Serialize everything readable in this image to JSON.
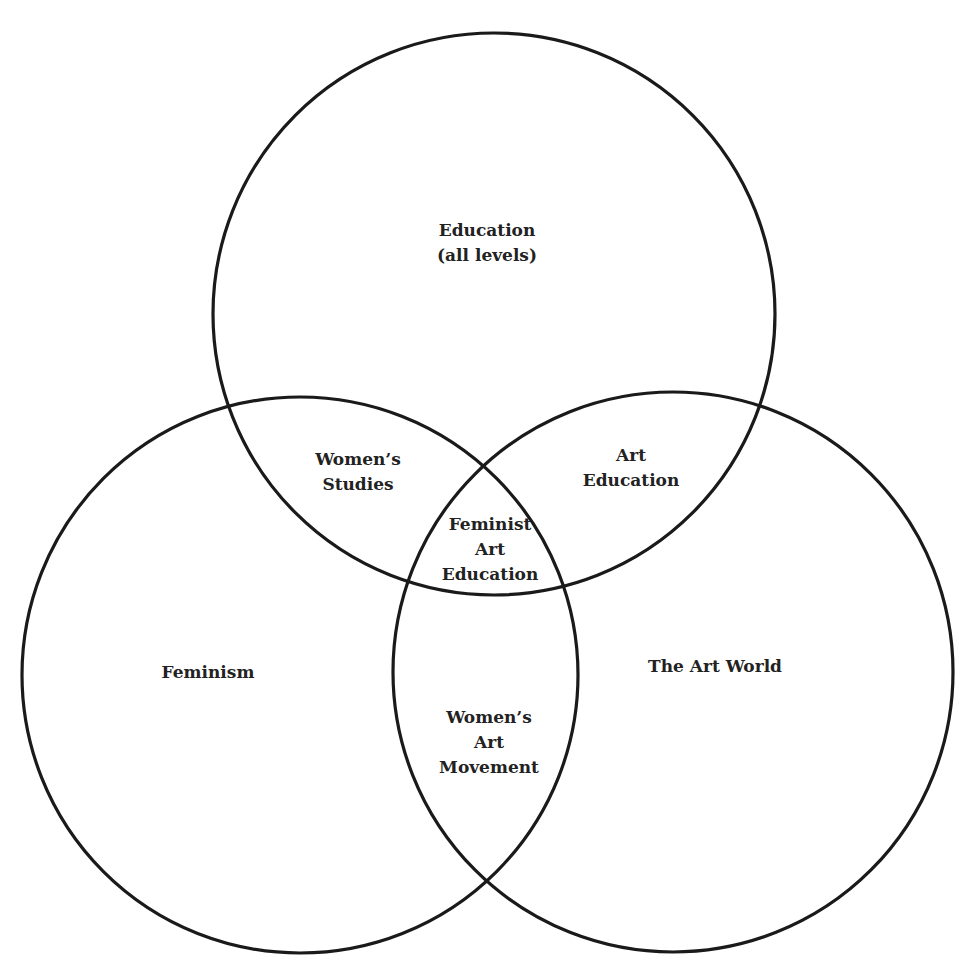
{
  "diagram": {
    "type": "venn",
    "stroke_color": "#1a1a1a",
    "background": "#ffffff",
    "circles": [
      {
        "id": "education",
        "cx": 494,
        "cy": 314,
        "r": 281
      },
      {
        "id": "feminism",
        "cx": 300,
        "cy": 675,
        "r": 278
      },
      {
        "id": "art-world",
        "cx": 673,
        "cy": 672,
        "r": 280
      }
    ],
    "regions": {
      "education": {
        "lines": [
          "Education",
          "(all levels)"
        ]
      },
      "womens_studies": {
        "lines": [
          "Women’s",
          "Studies"
        ]
      },
      "art_education": {
        "lines": [
          "Art",
          "Education"
        ]
      },
      "feminist_art_education": {
        "lines": [
          "Feminist",
          "Art",
          "Education"
        ]
      },
      "feminism": {
        "lines": [
          "Feminism"
        ]
      },
      "art_world": {
        "lines": [
          "The Art World"
        ]
      },
      "womens_art_movement": {
        "lines": [
          "Women’s",
          "Art",
          "Movement"
        ]
      }
    }
  }
}
